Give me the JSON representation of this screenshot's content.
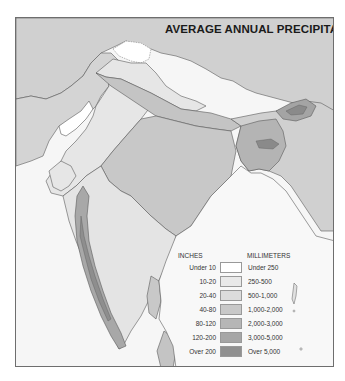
{
  "map": {
    "title": "AVERAGE ANNUAL PRECIPITATION",
    "region": "South Asia / Indian subcontinent"
  },
  "legend": {
    "header_inches": "INCHES",
    "header_mm": "MILLIMETERS",
    "items": [
      {
        "inches": "Under 10",
        "mm": "Under 250",
        "color": "#ffffff"
      },
      {
        "inches": "10-20",
        "mm": "250-500",
        "color": "#e9e9e9"
      },
      {
        "inches": "20-40",
        "mm": "500-1,000",
        "color": "#dcdcdc"
      },
      {
        "inches": "40-80",
        "mm": "1,000-2,000",
        "color": "#c8c8c8"
      },
      {
        "inches": "80-120",
        "mm": "2,000-3,000",
        "color": "#b6b6b6"
      },
      {
        "inches": "120-200",
        "mm": "3,000-5,000",
        "color": "#a6a6a6"
      },
      {
        "inches": "Over 200",
        "mm": "Over 5,000",
        "color": "#909090"
      }
    ]
  },
  "colors": {
    "frame_border": "#6e6e6e",
    "sea": "#f7f7f7",
    "outside_land": "#d2d2d2",
    "boundary_line": "#5a5a5a"
  }
}
